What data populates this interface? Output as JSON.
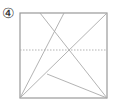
{
  "figure": {
    "label": "④",
    "square": {
      "x1": 20,
      "y1": 13,
      "x2": 107,
      "y2": 98
    },
    "lines": [
      {
        "name": "top-left-diagonal",
        "x1": 40,
        "y1": 13,
        "x2": 107,
        "y2": 98,
        "style": "solid"
      },
      {
        "name": "top-right-diagonal",
        "x1": 64,
        "y1": 13,
        "x2": 20,
        "y2": 98,
        "style": "solid"
      },
      {
        "name": "main-diagonal",
        "x1": 20,
        "y1": 98,
        "x2": 107,
        "y2": 13,
        "style": "solid"
      },
      {
        "name": "midline",
        "x1": 20,
        "y1": 50,
        "x2": 107,
        "y2": 50,
        "style": "dotted"
      },
      {
        "name": "lower-line",
        "x1": 47,
        "y1": 74,
        "x2": 107,
        "y2": 98,
        "style": "solid"
      }
    ],
    "colors": {
      "square": "#999999",
      "lines": "#aaaaaa"
    }
  }
}
